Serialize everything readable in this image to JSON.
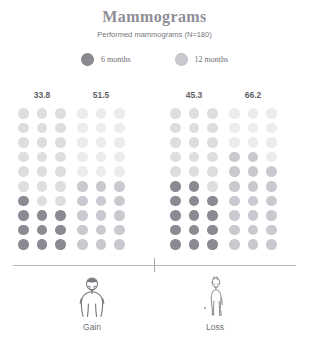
{
  "chart_data": {
    "type": "bar",
    "subtype": "waffle-dot-matrix",
    "title": "Mammograms",
    "subtitle": "Performed mammograms (N=180)",
    "xlabel": "",
    "ylabel": "",
    "unit": "percent",
    "grid": false,
    "legend_position": "top-center",
    "dots_per_group": 30,
    "grid_columns": 3,
    "grid_rows": 10,
    "percent_per_dot": 3.3333,
    "ylim": [
      0,
      100
    ],
    "categories": [
      "Gain",
      "Loss"
    ],
    "legend": [
      {
        "name": "6 months",
        "color": "#8a8a92"
      },
      {
        "name": "12 months",
        "color": "#c9c9cf"
      }
    ],
    "series": [
      {
        "name": "6 months",
        "values": [
          33.8,
          45.3
        ],
        "color": "#8a8a92",
        "empty_color": "#dededf"
      },
      {
        "name": "12 months",
        "values": [
          51.5,
          66.2
        ],
        "color": "#c9c9cf",
        "empty_color": "#ececee"
      }
    ],
    "groups": [
      {
        "label": "33.8",
        "value": 33.8,
        "series": "6 months",
        "category": "Gain",
        "fill_color": "#8a8a92",
        "empty_color": "#dededf",
        "filled_dots": 10,
        "left": 14
      },
      {
        "label": "51.5",
        "value": 51.5,
        "series": "12 months",
        "category": "Gain",
        "fill_color": "#c9c9cf",
        "empty_color": "#ececee",
        "filled_dots": 16,
        "left": 73
      },
      {
        "label": "45.3",
        "value": 45.3,
        "series": "6 months",
        "category": "Loss",
        "fill_color": "#8a8a92",
        "empty_color": "#dededf",
        "filled_dots": 14,
        "left": 166
      },
      {
        "label": "66.2",
        "value": 66.2,
        "series": "12 months",
        "category": "Loss",
        "fill_color": "#c9c9cf",
        "empty_color": "#ececee",
        "filled_dots": 20,
        "left": 225
      }
    ],
    "annotations": [
      {
        "name": "gain-figure-label",
        "text": "Gain"
      },
      {
        "name": "loss-figure-label",
        "text": "Loss"
      }
    ]
  },
  "figures": [
    {
      "label": "Gain",
      "icon": "person-heavy-icon",
      "left": 32
    },
    {
      "label": "Loss",
      "icon": "person-slim-icon",
      "left": 155
    }
  ],
  "colors": {
    "title": "#8e8e96",
    "text": "#6d6d73",
    "axis": "#b9b9bd",
    "dark_dot": "#8a8a92",
    "light_dot": "#c9c9cf",
    "dark_empty": "#dededf",
    "light_empty": "#ececee"
  }
}
